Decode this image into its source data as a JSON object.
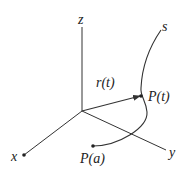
{
  "diagram": {
    "title": "",
    "labels": {
      "z_axis": "z",
      "x_axis": "x",
      "y_axis": "y",
      "position_vector": "r(t)",
      "point_t": "P(t)",
      "point_a": "P(a)",
      "curve_end": "s"
    },
    "colors": {
      "line": "#333333",
      "text": "#222222",
      "background": "#ffffff"
    }
  }
}
